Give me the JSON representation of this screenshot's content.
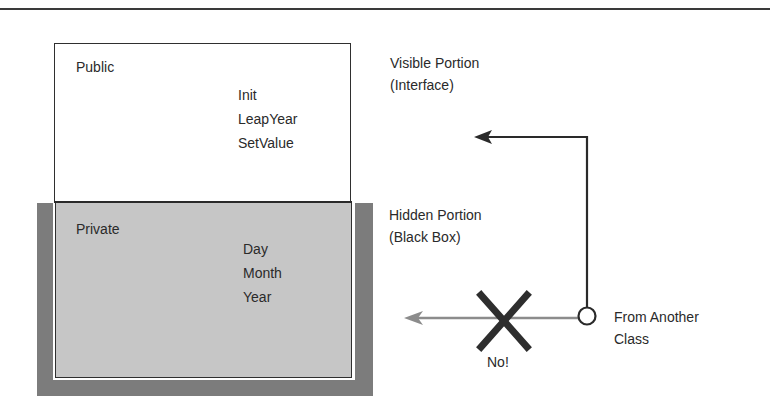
{
  "diagram": {
    "type": "class-encapsulation",
    "public_section": {
      "label": "Public",
      "members": [
        "Init",
        "LeapYear",
        "SetValue"
      ]
    },
    "private_section": {
      "label": "Private",
      "members": [
        "Day",
        "Month",
        "Year"
      ]
    },
    "annotations": {
      "visible": {
        "line1": "Visible Portion",
        "line2": "(Interface)"
      },
      "hidden": {
        "line1": "Hidden Portion",
        "line2": "(Black Box)"
      },
      "source": {
        "line1": "From Another",
        "line2": "Class"
      },
      "blocked": "No!"
    },
    "colors": {
      "rule": "#3a3a3a",
      "box_border": "#2f2f2f",
      "private_fill": "#c6c6c6",
      "outer_frame": "#7c7c7c",
      "allowed_arrow": "#2a2a2a",
      "blocked_arrow": "#8c8c8c",
      "cross": "#2e2e2e"
    },
    "connections": [
      {
        "from": "From Another Class",
        "to": "Visible Portion (Interface)",
        "allowed": true
      },
      {
        "from": "From Another Class",
        "to": "Hidden Portion (Black Box)",
        "allowed": false
      }
    ]
  }
}
